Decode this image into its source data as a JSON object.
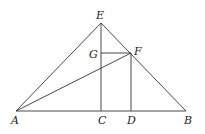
{
  "diagram": {
    "type": "geometry",
    "points": {
      "A": {
        "label": "A",
        "x": 16,
        "y": 111
      },
      "B": {
        "label": "B",
        "x": 186,
        "y": 111
      },
      "C": {
        "label": "C",
        "x": 101,
        "y": 111
      },
      "D": {
        "label": "D",
        "x": 131,
        "y": 111
      },
      "E": {
        "label": "E",
        "x": 101,
        "y": 23
      },
      "F": {
        "label": "F",
        "x": 131,
        "y": 53
      },
      "G": {
        "label": "G",
        "x": 101,
        "y": 53
      }
    },
    "segments": [
      "AB",
      "AE",
      "EB",
      "EC",
      "FD",
      "GF",
      "AF"
    ],
    "labels": {
      "A": "A",
      "B": "B",
      "C": "C",
      "D": "D",
      "E": "E",
      "F": "F",
      "G": "G"
    }
  }
}
